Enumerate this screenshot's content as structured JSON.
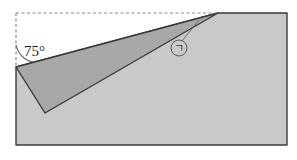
{
  "figure": {
    "type": "geometry-diagram",
    "canvas": {
      "width": 297,
      "height": 160,
      "background": "#ffffff"
    },
    "colors": {
      "outer_quad_fill": "#c9c9c9",
      "inner_triangle_fill": "#a8a8a8",
      "outline": "#3a3a3a",
      "dashed_guide": "#8a8a8a",
      "text": "#1a1a1a",
      "marker": "#3a3a3a"
    },
    "labels": {
      "angle": "75°",
      "marker": "ㄱ"
    },
    "shapes": {
      "outer_quad": {
        "name": "outer-quadrilateral",
        "fill": "#c9c9c9",
        "points": "16,67 218,13 287,13 287,145 16,145"
      },
      "inner_triangle": {
        "name": "inner-triangle",
        "fill": "#a8a8a8",
        "points": "16,67 218,13 45,113"
      },
      "dashed_guides": [
        {
          "name": "vertical-dashed-guide",
          "x1": 16,
          "y1": 13,
          "x2": 16,
          "y2": 67
        },
        {
          "name": "horizontal-dashed-guide",
          "x1": 16,
          "y1": 13,
          "x2": 218,
          "y2": 13
        }
      ],
      "angle_arc": {
        "name": "angle-arc-75",
        "path": "M 16 45 A 22 22 0 0 0 33 62"
      },
      "leader_line": {
        "name": "marker-leader-line",
        "x1": 182,
        "y1": 40,
        "x2": 198,
        "y2": 20
      },
      "marker_circle": {
        "name": "marker-circle",
        "cx": 179,
        "cy": 48,
        "r": 8
      }
    }
  }
}
